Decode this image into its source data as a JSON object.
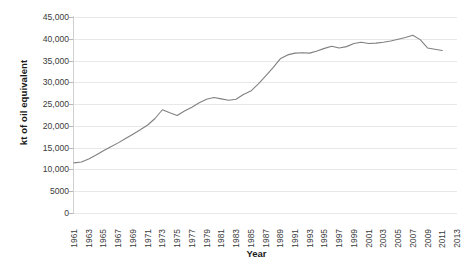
{
  "chart_data": {
    "type": "line",
    "title": "",
    "xlabel": "Year",
    "ylabel": "kt of oil equivalent",
    "xlim": [
      1961,
      2013
    ],
    "ylim": [
      0,
      45000
    ],
    "grid": true,
    "legend": "none",
    "line_color": "#808080",
    "ytick_labels": [
      "45,000",
      "40,000",
      "35,000",
      "30,000",
      "25,000",
      "20,000",
      "15,000",
      "10,000",
      "5000",
      "0"
    ],
    "ytick_values": [
      45000,
      40000,
      35000,
      30000,
      25000,
      20000,
      15000,
      10000,
      5000,
      0
    ],
    "xtick_labels": [
      "1961",
      "1963",
      "1965",
      "1967",
      "1969",
      "1971",
      "1973",
      "1975",
      "1977",
      "1979",
      "1981",
      "1983",
      "1985",
      "1987",
      "1989",
      "1991",
      "1993",
      "1995",
      "1997",
      "1999",
      "2001",
      "2003",
      "2005",
      "2007",
      "2009",
      "2011",
      "2013"
    ],
    "xtick_values": [
      1961,
      1963,
      1965,
      1967,
      1969,
      1971,
      1973,
      1975,
      1977,
      1979,
      1981,
      1983,
      1985,
      1987,
      1989,
      1991,
      1993,
      1995,
      1997,
      1999,
      2001,
      2003,
      2005,
      2007,
      2009,
      2011,
      2013
    ],
    "x": [
      1961,
      1962,
      1963,
      1964,
      1965,
      1966,
      1967,
      1968,
      1969,
      1970,
      1971,
      1972,
      1973,
      1974,
      1975,
      1976,
      1977,
      1978,
      1979,
      1980,
      1981,
      1982,
      1983,
      1984,
      1985,
      1986,
      1987,
      1988,
      1989,
      1990,
      1991,
      1992,
      1993,
      1994,
      1995,
      1996,
      1997,
      1998,
      1999,
      2000,
      2001,
      2002,
      2003,
      2004,
      2005,
      2006,
      2007,
      2008,
      2009,
      2010,
      2011
    ],
    "values": [
      11500,
      11700,
      12400,
      13300,
      14300,
      15200,
      16100,
      17100,
      18100,
      19100,
      20200,
      21700,
      23700,
      23000,
      22400,
      23400,
      24300,
      25300,
      26100,
      26500,
      26200,
      25900,
      26100,
      27200,
      28000,
      29600,
      31400,
      33300,
      35400,
      36300,
      36700,
      36800,
      36700,
      37200,
      37800,
      38300,
      37900,
      38200,
      38900,
      39200,
      38900,
      39000,
      39200,
      39500,
      39900,
      40300,
      40800,
      39800,
      37900,
      37600,
      37300
    ],
    "series_name": "Energy use (kt of oil equivalent)"
  }
}
